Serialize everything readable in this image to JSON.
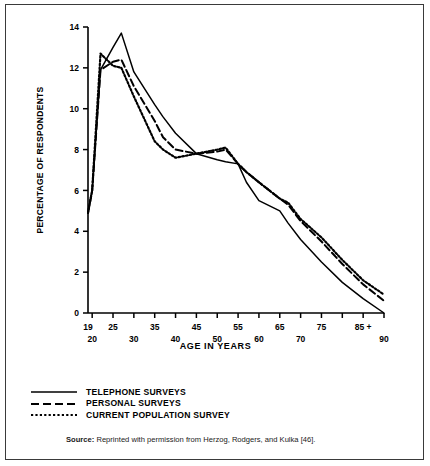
{
  "figure": {
    "ylabel": "PERCENTAGE OF RESPONDENTS",
    "xlabel": "AGE IN YEARS",
    "source_prefix": "Source:",
    "source_text": "Reprinted with permission from Herzog, Rodgers, and Kulka [46]."
  },
  "legend": {
    "items": [
      {
        "label": "TELEPHONE SURVEYS",
        "style": "solid"
      },
      {
        "label": "PERSONAL SURVEYS",
        "style": "dashed"
      },
      {
        "label": "CURRENT POPULATION SURVEY",
        "style": "dotted"
      }
    ]
  },
  "axis": {
    "y_ticks": [
      "0",
      "2",
      "4",
      "6",
      "8",
      "10",
      "12",
      "14"
    ],
    "x_ticks_top": [
      "19",
      "25",
      "35",
      "45",
      "55",
      "65",
      "75",
      "85 +"
    ],
    "x_ticks_bottom": [
      "20",
      "30",
      "40",
      "50",
      "60",
      "70",
      "90"
    ]
  },
  "chart_data": {
    "type": "line",
    "title": "",
    "xlabel": "AGE IN YEARS",
    "ylabel": "PERCENTAGE OF RESPONDENTS",
    "xlim": [
      19,
      90
    ],
    "ylim": [
      0,
      14
    ],
    "grid": false,
    "legend_position": "below-plot",
    "x": [
      19,
      20,
      22,
      25,
      27,
      30,
      35,
      37,
      40,
      45,
      50,
      52,
      55,
      57,
      60,
      65,
      67,
      70,
      75,
      80,
      85,
      90
    ],
    "series": [
      {
        "name": "TELEPHONE SURVEYS",
        "style": "solid",
        "values": [
          4.9,
          6.0,
          11.9,
          13.0,
          13.7,
          11.8,
          10.2,
          9.6,
          8.8,
          7.8,
          7.5,
          7.4,
          7.3,
          6.4,
          5.5,
          5.0,
          4.4,
          3.6,
          2.5,
          1.5,
          0.7,
          0.0
        ]
      },
      {
        "name": "PERSONAL SURVEYS",
        "style": "dashed",
        "values": [
          4.9,
          6.0,
          11.9,
          12.3,
          12.4,
          11.1,
          9.4,
          8.6,
          8.0,
          7.8,
          7.9,
          8.0,
          7.3,
          6.9,
          6.4,
          5.6,
          5.3,
          4.5,
          3.5,
          2.4,
          1.4,
          0.6
        ]
      },
      {
        "name": "CURRENT POPULATION SURVEY",
        "style": "dotted",
        "values": [
          4.9,
          6.0,
          12.7,
          12.1,
          12.0,
          10.6,
          8.4,
          8.0,
          7.6,
          7.8,
          8.0,
          8.1,
          7.3,
          6.9,
          6.4,
          5.6,
          5.4,
          4.6,
          3.7,
          2.6,
          1.6,
          0.9
        ]
      }
    ],
    "annotations": [
      "All three surveys converge near age 19 at about 4.9 percent.",
      "Telephone surveys peak highest near age 27 at about 13.7 percent."
    ]
  },
  "colors": {
    "line": "#000000",
    "frame": "#3a3a3a",
    "background": "#ffffff"
  }
}
